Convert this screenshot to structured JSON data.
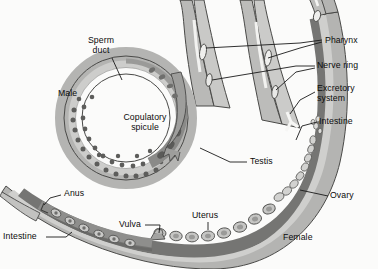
{
  "figure": {
    "background_color": "#fbfbfa",
    "ink_color": "#0b0b0b"
  },
  "palette": {
    "body_light": "#c9c9c7",
    "body_mid": "#a8a8a6",
    "body_dark": "#8a8a88",
    "organ_dark": "#6f6f6d",
    "cell_fill": "#bdbdbb",
    "sperm_dot": "#5d5d5b",
    "outline": "#4a4a48",
    "leader": "#1a1a1a"
  },
  "labels": [
    {
      "id": "sperm-duct",
      "text": "Sperm\nduct",
      "x": 100,
      "y": 41,
      "align": "center"
    },
    {
      "id": "male",
      "text": "Male",
      "x": 58,
      "y": 93,
      "align": "left"
    },
    {
      "id": "copulatory-spicule",
      "text": "Copulatory\nspicule",
      "x": 154,
      "y": 118,
      "align": "center"
    },
    {
      "id": "pharynx",
      "text": "Pharynx",
      "x": 325,
      "y": 40,
      "align": "left"
    },
    {
      "id": "nerve-ring",
      "text": "Nerve ring",
      "x": 318,
      "y": 64,
      "align": "left"
    },
    {
      "id": "excretory-system",
      "text": "Excretory\nsystem",
      "x": 318,
      "y": 88,
      "align": "left"
    },
    {
      "id": "intestine-right",
      "text": "Intestine",
      "x": 320,
      "y": 120,
      "align": "left"
    },
    {
      "id": "ovary",
      "text": "Ovary",
      "x": 330,
      "y": 194,
      "align": "left"
    },
    {
      "id": "testis",
      "text": "Testis",
      "x": 250,
      "y": 160,
      "align": "left"
    },
    {
      "id": "anus",
      "text": "Anus",
      "x": 63,
      "y": 193,
      "align": "left"
    },
    {
      "id": "intestine-left",
      "text": "Intestine",
      "x": 4,
      "y": 234,
      "align": "left"
    },
    {
      "id": "vulva",
      "text": "Vulva",
      "x": 121,
      "y": 222,
      "align": "left"
    },
    {
      "id": "uterus",
      "text": "Uterus",
      "x": 195,
      "y": 214,
      "align": "left"
    },
    {
      "id": "female",
      "text": "Female",
      "x": 283,
      "y": 236,
      "align": "left"
    }
  ],
  "organs": {
    "male": [
      "sperm duct",
      "copulatory spicule",
      "testis",
      "pharynx",
      "nerve ring"
    ],
    "female": [
      "pharynx",
      "nerve ring",
      "excretory system",
      "intestine",
      "ovary",
      "uterus",
      "vulva",
      "anus"
    ]
  }
}
